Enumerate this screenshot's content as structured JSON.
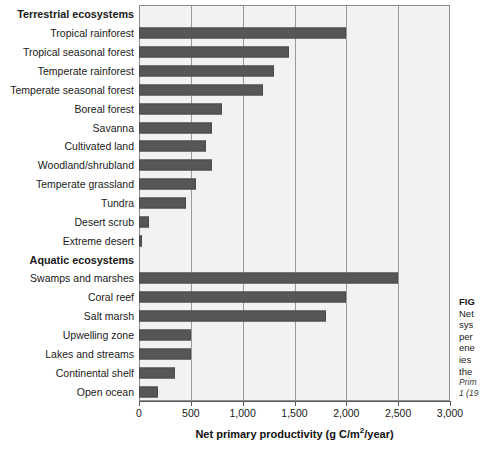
{
  "chart_data": {
    "type": "bar",
    "orientation": "horizontal",
    "title": "",
    "xlabel": "Net primary productivity (g C/m2/year)",
    "xlabel_parts": {
      "before": "Net primary productivity (g C/m",
      "sup": "2",
      "after": "/year)"
    },
    "ylabel": "",
    "xlim": [
      0,
      3000
    ],
    "xticks": [
      0,
      500,
      1000,
      1500,
      2000,
      2500,
      3000
    ],
    "xticklabels": [
      "0",
      "500",
      "1,000",
      "1,500",
      "2,000",
      "2,500",
      "3,000"
    ],
    "grid": "vertical",
    "legend": "none",
    "bar_color": "#565656",
    "plot_background": "#f2f2f2",
    "groups": [
      {
        "label": "Terrestrial ecosystems",
        "categories": [
          "Tropical rainforest",
          "Tropical seasonal forest",
          "Temperate rainforest",
          "Temperate seasonal forest",
          "Boreal forest",
          "Savanna",
          "Cultivated land",
          "Woodland/shrubland",
          "Temperate grassland",
          "Tundra",
          "Desert scrub",
          "Extreme desert"
        ],
        "values": [
          2000,
          1450,
          1300,
          1200,
          800,
          700,
          650,
          700,
          550,
          450,
          100,
          30
        ]
      },
      {
        "label": "Aquatic ecosystems",
        "categories": [
          "Swamps and marshes",
          "Coral reef",
          "Salt marsh",
          "Upwelling zone",
          "Lakes and streams",
          "Continental shelf",
          "Open ocean"
        ],
        "values": [
          2500,
          2000,
          1800,
          500,
          500,
          350,
          180
        ]
      }
    ]
  },
  "caption": {
    "lines": [
      "FIG",
      "Net",
      "sys",
      "per",
      "ene",
      "ies",
      "the"
    ],
    "source_lines": [
      "Prim",
      "1 (19"
    ]
  }
}
